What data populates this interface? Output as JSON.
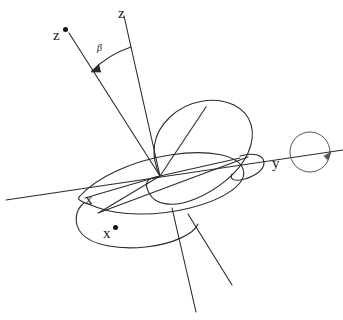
{
  "figure": {
    "kind": "line-diagram",
    "background_color": "#ffffff",
    "stroke_color": "#2b2b2b",
    "label_color": "#1a1a1a"
  },
  "labels": {
    "z": "z",
    "z_star": "z",
    "z_star_mark": "•",
    "beta": "β",
    "x": "x",
    "x_star": "x",
    "x_star_mark": "•",
    "y": "y"
  },
  "geometry": {
    "origin": {
      "x": 160,
      "y": 176
    },
    "axes": [
      {
        "name": "z",
        "label": "z",
        "tip": {
          "x": 124,
          "y": 16
        },
        "negative_tip": {
          "x": 196,
          "y": 312
        }
      },
      {
        "name": "z-star",
        "label": "z*",
        "tip": {
          "x": 69,
          "y": 33
        },
        "negative_tip": {
          "x": 232,
          "y": 285
        }
      },
      {
        "name": "x",
        "label": "x",
        "tip": {
          "x": 6,
          "y": 200
        },
        "negative_tip": {
          "x": 343,
          "y": 150
        }
      },
      {
        "name": "x-star",
        "label": "x*",
        "tip": {
          "x": 98,
          "y": 213
        },
        "negative_tip": {
          "x": 239,
          "y": 160
        }
      },
      {
        "name": "y",
        "label": "y",
        "tip": {
          "x": 330,
          "y": 152
        }
      }
    ],
    "angle_arc": {
      "between": [
        "z",
        "z-star"
      ],
      "label": "β",
      "arrow_at": "z-star"
    },
    "rotation_indicator": {
      "shape": "circle",
      "center": {
        "x": 310,
        "y": 152
      },
      "radius": 20,
      "on_axis": "y"
    },
    "ellipses": [
      {
        "name": "primary-orbital-plane",
        "tilt": "major"
      },
      {
        "name": "secondary-orbital-plane",
        "tilt": "flat"
      },
      {
        "name": "lower-lobe",
        "tilt": "flat-lower"
      },
      {
        "name": "right-lobe",
        "tilt": "small-right"
      }
    ]
  }
}
